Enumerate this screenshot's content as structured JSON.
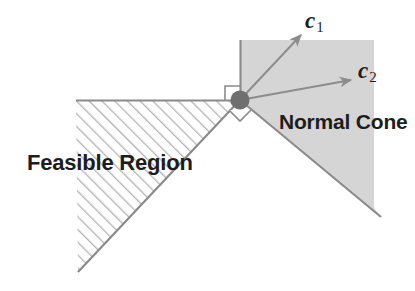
{
  "figure": {
    "title_visible": false,
    "background": "#ffffff",
    "labels": {
      "feasible_region": "Feasible Region",
      "normal_cone": "Normal Cone",
      "vector_c1_base": "c",
      "vector_c1_sub": "1",
      "vector_c2_base": "c",
      "vector_c2_sub": "2"
    },
    "colors": {
      "cone_fill": "#d5d5d5",
      "line": "#7d7d7d",
      "boundary": "#8a8a8a",
      "vertex_dot": "#6f6f6f",
      "hatch": "#b9b9b9",
      "text": "#1d1d1d",
      "arrow": "#8c8c8c"
    },
    "geometry": {
      "vertex": {
        "x": 240,
        "y": 100
      },
      "horizontal_constraint": {
        "x1": 76,
        "y1": 100,
        "x2": 240,
        "y2": 100
      },
      "diagonal_constraint": {
        "x1": 78,
        "y1": 272,
        "x2": 240,
        "y2": 100
      },
      "cone_vertical_edge": {
        "x1": 240,
        "y1": 40,
        "x2": 240,
        "y2": 100
      },
      "cone_diagonal_edge": {
        "x1": 240,
        "y1": 100,
        "x2": 381,
        "y2": 217
      },
      "cone_top_right": {
        "x": 374,
        "y": 40
      },
      "arrow_c1": {
        "x1": 240,
        "y1": 100,
        "x2": 303,
        "y2": 33
      },
      "arrow_c2": {
        "x1": 240,
        "y1": 100,
        "x2": 354,
        "y2": 80
      },
      "right_angle_marker_upper": {
        "x": 225,
        "y": 85,
        "size": 14
      },
      "right_angle_marker_lower": {
        "x": 240,
        "y": 103,
        "size": 15
      }
    }
  }
}
